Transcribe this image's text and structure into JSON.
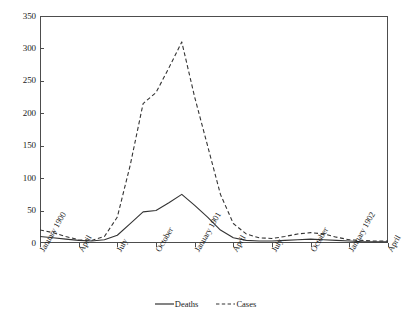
{
  "chart_data": {
    "type": "line",
    "title": "",
    "xlabel": "",
    "ylabel": "",
    "ylim": [
      0,
      350
    ],
    "y_ticks": [
      0,
      50,
      100,
      150,
      200,
      250,
      300,
      350
    ],
    "grid": false,
    "legend_position": "bottom",
    "categories": [
      "January 1900",
      "February 1900",
      "March 1900",
      "April 1900",
      "May 1900",
      "June 1900",
      "July 1900",
      "August 1900",
      "September 1900",
      "October 1900",
      "November 1900",
      "December 1900",
      "January 1901",
      "February 1901",
      "March 1901",
      "April 1901",
      "May 1901",
      "June 1901",
      "July 1901",
      "August 1901",
      "September 1901",
      "October 1901",
      "November 1901",
      "December 1901",
      "January 1902",
      "February 1902",
      "March 1902",
      "April 1902"
    ],
    "x_tick_labels": [
      "January 1900",
      "April",
      "July",
      "October",
      "January 1901",
      "April",
      "July",
      "October",
      "January 1902",
      "April"
    ],
    "x_tick_indices": [
      0,
      3,
      6,
      9,
      12,
      15,
      18,
      21,
      24,
      27
    ],
    "series": [
      {
        "name": "Deaths",
        "style": "solid",
        "color": "#333333",
        "values": [
          10,
          8,
          6,
          4,
          3,
          5,
          12,
          30,
          48,
          50,
          62,
          75,
          58,
          40,
          20,
          8,
          4,
          3,
          3,
          4,
          5,
          6,
          5,
          4,
          3,
          2,
          2,
          2
        ]
      },
      {
        "name": "Cases",
        "style": "dashed",
        "color": "#333333",
        "values": [
          20,
          16,
          10,
          5,
          4,
          10,
          40,
          120,
          215,
          232,
          270,
          310,
          225,
          150,
          75,
          30,
          14,
          8,
          7,
          10,
          14,
          16,
          14,
          9,
          5,
          4,
          3,
          3
        ]
      }
    ]
  },
  "legend": {
    "entries": [
      {
        "label": "Deaths",
        "style": "solid"
      },
      {
        "label": "Cases",
        "style": "dashed"
      }
    ]
  }
}
